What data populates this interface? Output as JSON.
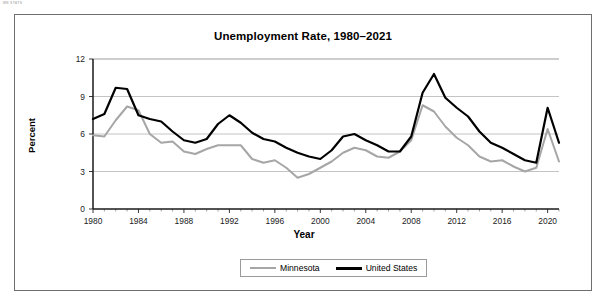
{
  "page": {
    "faint_header": "MN STATS"
  },
  "chart": {
    "title": "Unemployment Rate, 1980–2021",
    "xlabel": "Year",
    "ylabel": "Percent",
    "legend": [
      {
        "label": "Minnesota",
        "color": "#a6a6a6",
        "swatch": "mn"
      },
      {
        "label": "United States",
        "color": "#000000",
        "swatch": "us"
      }
    ],
    "ytick_labels": [
      "0",
      "3",
      "6",
      "9",
      "12"
    ],
    "xtick_labels": [
      "1980",
      "1984",
      "1988",
      "1992",
      "1996",
      "2000",
      "2004",
      "2008",
      "2012",
      "2016",
      "2020"
    ]
  },
  "chart_data": {
    "type": "line",
    "title": "Unemployment Rate, 1980–2021",
    "xlabel": "Year",
    "ylabel": "Percent",
    "xlim": [
      1980,
      2021
    ],
    "ylim": [
      0,
      12
    ],
    "yticks": [
      0,
      3,
      6,
      9,
      12
    ],
    "xticks": [
      1980,
      1984,
      1988,
      1992,
      1996,
      2000,
      2004,
      2008,
      2012,
      2016,
      2020
    ],
    "grid": "horizontal",
    "legend_position": "bottom",
    "x": [
      1980,
      1981,
      1982,
      1983,
      1984,
      1985,
      1986,
      1987,
      1988,
      1989,
      1990,
      1991,
      1992,
      1993,
      1994,
      1995,
      1996,
      1997,
      1998,
      1999,
      2000,
      2001,
      2002,
      2003,
      2004,
      2005,
      2006,
      2007,
      2008,
      2009,
      2010,
      2011,
      2012,
      2013,
      2014,
      2015,
      2016,
      2017,
      2018,
      2019,
      2020,
      2021
    ],
    "series": [
      {
        "name": "Minnesota",
        "color": "#a6a6a6",
        "values": [
          5.9,
          5.8,
          7.1,
          8.2,
          7.9,
          6.0,
          5.3,
          5.4,
          4.6,
          4.4,
          4.8,
          5.1,
          5.1,
          5.1,
          4.0,
          3.7,
          3.9,
          3.3,
          2.5,
          2.8,
          3.3,
          3.8,
          4.5,
          4.9,
          4.7,
          4.2,
          4.1,
          4.6,
          5.5,
          8.3,
          7.8,
          6.6,
          5.7,
          5.1,
          4.2,
          3.8,
          3.9,
          3.4,
          3.0,
          3.3,
          6.4,
          3.8
        ]
      },
      {
        "name": "United States",
        "color": "#000000",
        "values": [
          7.2,
          7.6,
          9.7,
          9.6,
          7.5,
          7.2,
          7.0,
          6.2,
          5.5,
          5.3,
          5.6,
          6.8,
          7.5,
          6.9,
          6.1,
          5.6,
          5.4,
          4.9,
          4.5,
          4.2,
          4.0,
          4.7,
          5.8,
          6.0,
          5.5,
          5.1,
          4.6,
          4.6,
          5.8,
          9.3,
          10.8,
          8.9,
          8.1,
          7.4,
          6.2,
          5.3,
          4.9,
          4.4,
          3.9,
          3.7,
          8.1,
          5.3
        ]
      }
    ]
  }
}
